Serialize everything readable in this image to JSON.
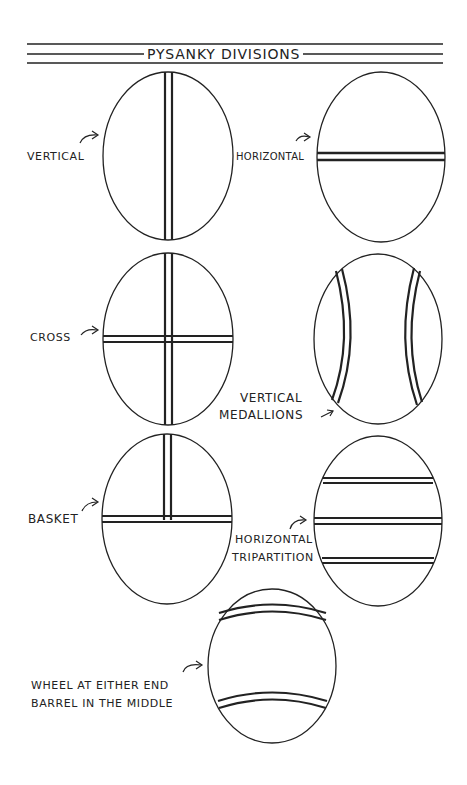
{
  "title": "PYSANKY DIVISIONS",
  "colors": {
    "ink": "#222222",
    "background": "#ffffff"
  },
  "divisions": [
    {
      "id": "vertical",
      "label": "VERTICAL"
    },
    {
      "id": "horizontal",
      "label": "HORIZONTAL"
    },
    {
      "id": "cross",
      "label": "CROSS"
    },
    {
      "id": "vertical-medallions",
      "label_line1": "VERTICAL",
      "label_line2": "MEDALLIONS"
    },
    {
      "id": "basket",
      "label": "BASKET"
    },
    {
      "id": "horizontal-tripartition",
      "label_line1": "HORIZONTAL",
      "label_line2": "TRIPARTITION"
    },
    {
      "id": "wheel-barrel",
      "label_line1": "WHEEL AT EITHER END",
      "label_line2": "BARREL IN THE MIDDLE"
    }
  ]
}
